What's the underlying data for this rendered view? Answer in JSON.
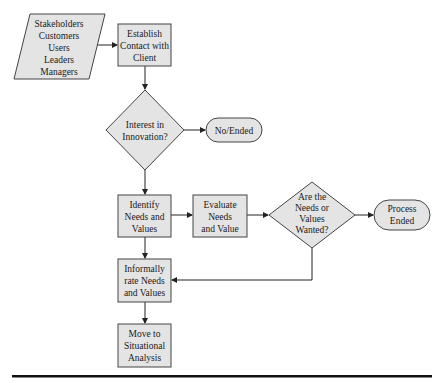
{
  "diagram": {
    "type": "flowchart",
    "colors": {
      "node_fill": "#e4e4e4",
      "node_stroke": "#444444",
      "edge": "#222222",
      "rule": "#111111"
    },
    "nodes": {
      "stakeholders": {
        "shape": "parallelogram",
        "lines": [
          "Stakeholders",
          "Customers",
          "Users",
          "Leaders",
          "Managers"
        ]
      },
      "establish": {
        "shape": "rectangle",
        "lines": [
          "Establish",
          "Contact with",
          "Client"
        ]
      },
      "interest": {
        "shape": "diamond",
        "lines": [
          "Interest in",
          "Innovation?"
        ]
      },
      "no_ended": {
        "shape": "terminator",
        "lines": [
          "No/Ended"
        ]
      },
      "identify": {
        "shape": "rectangle",
        "lines": [
          "Identify",
          "Needs and",
          "Values"
        ]
      },
      "evaluate": {
        "shape": "rectangle",
        "lines": [
          "Evaluate",
          "Needs",
          "and Value"
        ]
      },
      "wanted": {
        "shape": "diamond",
        "lines": [
          "Are the",
          "Needs or",
          "Values",
          "Wanted?"
        ]
      },
      "process_ended": {
        "shape": "terminator",
        "lines": [
          "Process",
          "Ended"
        ]
      },
      "informally": {
        "shape": "rectangle",
        "lines": [
          "Informally",
          "rate Needs",
          "and Values"
        ]
      },
      "move": {
        "shape": "rectangle",
        "lines": [
          "Move to",
          "Situational",
          "Analysis"
        ]
      }
    },
    "edges": [
      {
        "from": "stakeholders",
        "to": "establish"
      },
      {
        "from": "establish",
        "to": "interest"
      },
      {
        "from": "interest",
        "to": "no_ended"
      },
      {
        "from": "interest",
        "to": "identify"
      },
      {
        "from": "identify",
        "to": "evaluate"
      },
      {
        "from": "evaluate",
        "to": "wanted"
      },
      {
        "from": "wanted",
        "to": "process_ended"
      },
      {
        "from": "wanted",
        "to": "informally"
      },
      {
        "from": "identify",
        "to": "informally"
      },
      {
        "from": "informally",
        "to": "move"
      }
    ]
  }
}
